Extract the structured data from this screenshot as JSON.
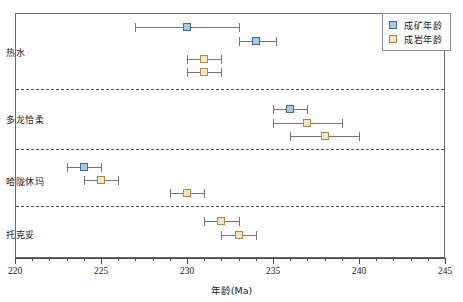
{
  "chart_data": {
    "type": "scatter",
    "title": "",
    "xlabel": "年龄(Ma)",
    "ylabel": "",
    "xlim": [
      220,
      245
    ],
    "xticks": [
      220,
      225,
      230,
      235,
      240,
      245
    ],
    "xtick_labels": [
      "220",
      "225",
      "230",
      "235",
      "240",
      "245"
    ],
    "minor_tick_step": 1,
    "grid": false,
    "legend_position": "top-right",
    "legend": [
      {
        "key": "ore",
        "label": "成矿年龄",
        "fill": "#a9c9e2",
        "stroke": "#3a6ea5"
      },
      {
        "key": "rock",
        "label": "成岩年龄",
        "fill": "#f3e5c6",
        "stroke": "#b5893f"
      }
    ],
    "categories": [
      "热水",
      "多龙恰柔",
      "哈陇休玛",
      "托克妥"
    ],
    "groups": [
      {
        "name": "热水",
        "points": [
          {
            "series": "ore",
            "value": 230.0,
            "low": 227.0,
            "high": 233.0
          },
          {
            "series": "ore",
            "value": 234.0,
            "low": 233.0,
            "high": 235.2
          },
          {
            "series": "rock",
            "value": 231.0,
            "low": 230.0,
            "high": 232.0
          },
          {
            "series": "rock",
            "value": 231.0,
            "low": 230.0,
            "high": 232.0
          }
        ]
      },
      {
        "name": "多龙恰柔",
        "points": [
          {
            "series": "ore",
            "value": 236.0,
            "low": 235.0,
            "high": 237.0
          },
          {
            "series": "rock",
            "value": 237.0,
            "low": 235.0,
            "high": 239.0
          },
          {
            "series": "rock",
            "value": 238.0,
            "low": 236.0,
            "high": 240.0
          }
        ]
      },
      {
        "name": "哈陇休玛",
        "points": [
          {
            "series": "ore",
            "value": 224.0,
            "low": 223.0,
            "high": 225.0
          },
          {
            "series": "rock",
            "value": 225.0,
            "low": 224.0,
            "high": 226.0
          },
          {
            "series": "rock",
            "value": 230.0,
            "low": 229.0,
            "high": 231.0
          }
        ]
      },
      {
        "name": "托克妥",
        "points": [
          {
            "series": "rock",
            "value": 232.0,
            "low": 231.0,
            "high": 233.0
          },
          {
            "series": "rock",
            "value": 233.0,
            "low": 232.0,
            "high": 234.0
          }
        ]
      }
    ]
  },
  "layout": {
    "plot_left": 15,
    "plot_top": 13,
    "plot_width": 430,
    "plot_height": 245,
    "group_boundaries": [
      88,
      148,
      205
    ],
    "category_label_y": [
      46,
      113,
      175,
      228
    ],
    "row_y": [
      22,
      36,
      54,
      67,
      104,
      118,
      131,
      162,
      175,
      188,
      216,
      230
    ]
  }
}
